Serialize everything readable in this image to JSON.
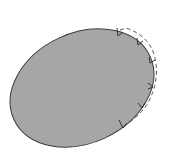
{
  "diagram": {
    "background": "#ffffff",
    "ellipse": {
      "cx": 82,
      "cy": 88,
      "rx": 75,
      "ry": 55,
      "rotation": -25,
      "fill": "#a6a6a6",
      "stroke": "#3a3a3a"
    },
    "dashed_boundary": {
      "stroke": "#555555",
      "dash": "4 3"
    },
    "arrow_markers": {
      "count": 6,
      "stroke": "#333333"
    }
  }
}
